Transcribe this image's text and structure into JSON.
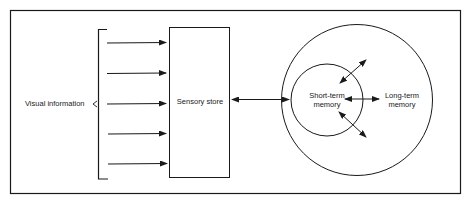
{
  "diagram": {
    "labels": {
      "input": "Visual information",
      "sensory": "Sensory store",
      "short_term_1": "Short-term",
      "short_term_2": "memory",
      "long_term_1": "Long-term",
      "long_term_2": "memory"
    },
    "input_arrows": 5,
    "colors": {
      "stroke": "#1a1a1a",
      "background": "#ffffff"
    }
  }
}
